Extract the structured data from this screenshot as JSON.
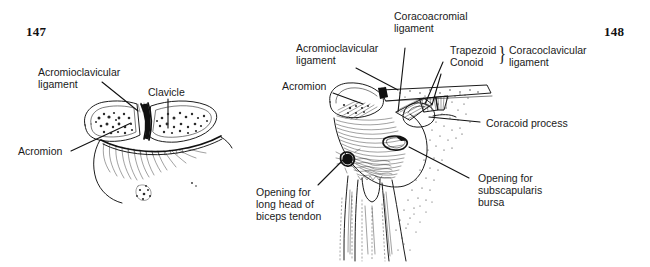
{
  "page": {
    "background_color": "#ffffff",
    "ink_color": "#111111",
    "width": 650,
    "height": 267
  },
  "figures": [
    {
      "number": "147",
      "caption_position": "top-left",
      "subject": "Acromioclavicular joint, coronal section",
      "labels": [
        {
          "id": "acromioclavicular-ligament",
          "text": "Acromioclavicular\nligament",
          "line1": "Acromioclavicular",
          "line2": "ligament"
        },
        {
          "id": "clavicle",
          "text": "Clavicle",
          "line1": "Clavicle",
          "line2": ""
        },
        {
          "id": "acromion",
          "text": "Acromion",
          "line1": "Acromion",
          "line2": ""
        }
      ]
    },
    {
      "number": "148",
      "caption_position": "top-right",
      "subject": "Shoulder joint, anterior view with ligaments",
      "labels": [
        {
          "id": "coracoacromial-ligament",
          "line1": "Coracoacromial",
          "line2": "ligament"
        },
        {
          "id": "acromioclavicular-ligament",
          "line1": "Acromioclavicular",
          "line2": "ligament"
        },
        {
          "id": "acromion",
          "line1": "Acromion",
          "line2": ""
        },
        {
          "id": "trapezoid",
          "line1": "Trapezoid",
          "line2": ""
        },
        {
          "id": "conoid",
          "line1": "Conoid",
          "line2": ""
        },
        {
          "id": "coracoclavicular-ligament",
          "line1": "Coracoclavicular",
          "line2": "ligament"
        },
        {
          "id": "coracoid-process",
          "line1": "Coracoid process",
          "line2": ""
        },
        {
          "id": "opening-subscapularis-bursa",
          "line1": "Opening for",
          "line2": "subscapularis",
          "line3": "bursa"
        },
        {
          "id": "opening-biceps-tendon",
          "line1": "Opening for",
          "line2": "long head of",
          "line3": "biceps tendon"
        }
      ],
      "brace_glyph": "}"
    }
  ],
  "fig147": {
    "number": "147",
    "label_acl_line1": "Acromioclavicular",
    "label_acl_line2": "ligament",
    "label_clavicle": "Clavicle",
    "label_acromion": "Acromion"
  },
  "fig148": {
    "number": "148",
    "label_cal_line1": "Coracoacromial",
    "label_cal_line2": "ligament",
    "label_acl_line1": "Acromioclavicular",
    "label_acl_line2": "ligament",
    "label_acromion": "Acromion",
    "label_trapezoid": "Trapezoid",
    "label_conoid": "Conoid",
    "label_ccl_line1": "Coracoclavicular",
    "label_ccl_line2": "ligament",
    "label_coracoid": "Coracoid process",
    "label_bursa_line1": "Opening for",
    "label_bursa_line2": "subscapularis",
    "label_bursa_line3": "bursa",
    "label_biceps_line1": "Opening for",
    "label_biceps_line2": "long head of",
    "label_biceps_line3": "biceps tendon",
    "brace": "}"
  }
}
